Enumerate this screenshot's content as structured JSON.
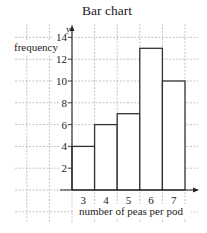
{
  "chart_data": {
    "type": "bar",
    "title": "Bar chart",
    "xlabel": "number of peas per pod",
    "ylabel": "frequency",
    "y_axis_letter": "y",
    "categories": [
      "3",
      "4",
      "5",
      "6",
      "7"
    ],
    "values": [
      4,
      6,
      7,
      13,
      10
    ],
    "yticks": [
      "2",
      "4",
      "6",
      "8",
      "10",
      "12",
      "14"
    ],
    "ylim": [
      0,
      14
    ],
    "grid": true,
    "legend": null
  },
  "colors": {
    "bar_stroke": "#333333",
    "grid": "#b5b5b5",
    "axis": "#222222"
  }
}
